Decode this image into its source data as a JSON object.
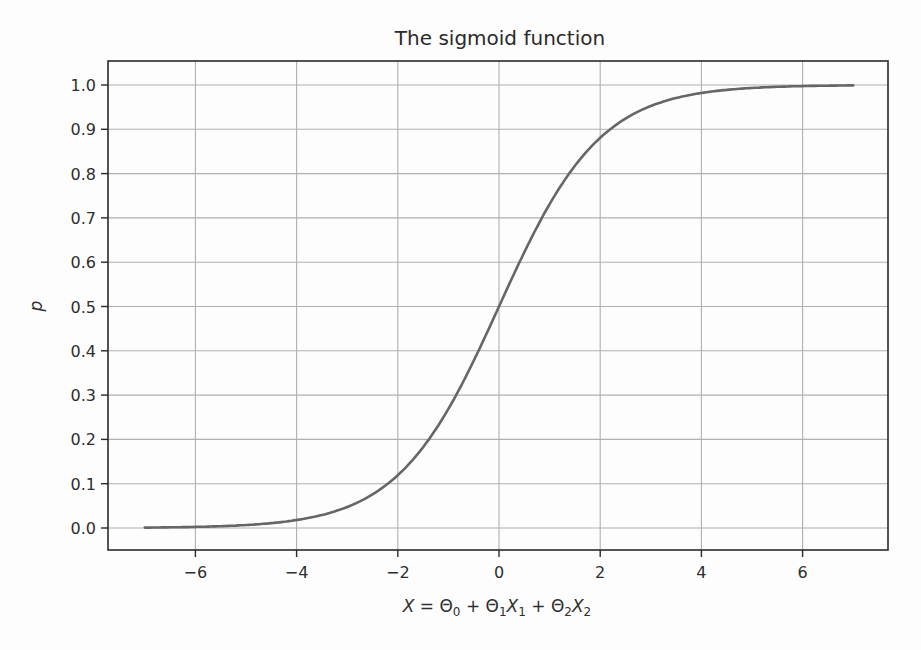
{
  "chart_data": {
    "type": "line",
    "title": "The sigmoid function",
    "xlabel": "X = Θ₀ + Θ₁X₁ + Θ₂X₂",
    "xlabel_parts": [
      {
        "t": "X",
        "i": true
      },
      {
        "t": " = Θ",
        "i": false
      },
      {
        "t": "0",
        "sub": true
      },
      {
        "t": " + Θ",
        "i": false
      },
      {
        "t": "1",
        "sub": true
      },
      {
        "t": "X",
        "i": true
      },
      {
        "t": "1",
        "sub": true
      },
      {
        "t": " + Θ",
        "i": false
      },
      {
        "t": "2",
        "sub": true
      },
      {
        "t": "X",
        "i": true
      },
      {
        "t": "2",
        "sub": true
      }
    ],
    "ylabel": "p",
    "xlim": [
      -7.7,
      7.7
    ],
    "ylim": [
      -0.05,
      1.05
    ],
    "xticks": [
      -6,
      -4,
      -2,
      0,
      2,
      4,
      6
    ],
    "xtick_labels": [
      "−6",
      "−4",
      "−2",
      "0",
      "2",
      "4",
      "6"
    ],
    "yticks": [
      0.0,
      0.1,
      0.2,
      0.3,
      0.4,
      0.5,
      0.6,
      0.7,
      0.8,
      0.9,
      1.0
    ],
    "ytick_labels": [
      "0.0",
      "0.1",
      "0.2",
      "0.3",
      "0.4",
      "0.5",
      "0.6",
      "0.7",
      "0.8",
      "0.9",
      "1.0"
    ],
    "grid": true,
    "legend": null,
    "series": [
      {
        "name": "sigmoid",
        "function": "1/(1+exp(-x))",
        "x": [
          -7,
          -6,
          -5,
          -4,
          -3,
          -2,
          -1,
          0,
          1,
          2,
          3,
          4,
          5,
          6,
          7
        ],
        "values": [
          0.001,
          0.002,
          0.007,
          0.018,
          0.047,
          0.119,
          0.269,
          0.5,
          0.731,
          0.881,
          0.953,
          0.982,
          0.993,
          0.998,
          0.999
        ],
        "color": "#666666"
      }
    ]
  },
  "colors": {
    "line": "#666666",
    "grid": "#b0b0b0",
    "axes": "#2a2a2a",
    "background": "#fdfdfd"
  }
}
